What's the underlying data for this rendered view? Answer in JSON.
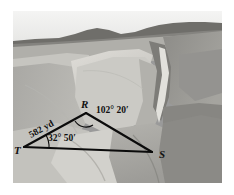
{
  "figure": {
    "type": "survey-diagram-over-photograph",
    "scene_description": "Grayscale aerial photograph of an eroded canyon and mesa landscape with a distant ridge horizon",
    "border_color": "#ffffff",
    "ink_color": "#0b0b0b"
  },
  "triangle": {
    "vertices": [
      {
        "id": "T",
        "label": "T",
        "x": 24,
        "y": 147,
        "label_x": 14,
        "label_y": 154
      },
      {
        "id": "R",
        "label": "R",
        "x": 86,
        "y": 113,
        "label_x": 81,
        "label_y": 108
      },
      {
        "id": "S",
        "label": "S",
        "x": 152,
        "y": 152,
        "label_x": 159,
        "label_y": 158
      }
    ],
    "sides": [
      {
        "from": "T",
        "to": "R",
        "label": "582 yd"
      },
      {
        "from": "R",
        "to": "S",
        "label": ""
      },
      {
        "from": "T",
        "to": "S",
        "label": ""
      }
    ],
    "measurements": [
      {
        "at": "T",
        "text": "32° 50′",
        "value_degrees": 32,
        "value_minutes": 50
      },
      {
        "at": "R",
        "text": "102° 20′",
        "value_degrees": 102,
        "value_minutes": 20
      }
    ],
    "distance": {
      "side": "TR",
      "text": "582 yd",
      "value": 582,
      "unit": "yd",
      "rotation_deg": -29
    }
  },
  "labels": {
    "vertex_t": "T",
    "vertex_r": "R",
    "vertex_s": "S",
    "distance_tr": "582 yd",
    "angle_r": "102° 20′",
    "angle_t": "32° 50′"
  },
  "palette": {
    "sky": "#f0f0ef",
    "ridge_dark": "#5d5d5d",
    "ridge_mid": "#7b7b7b",
    "mesa_light": "#c9c8c3",
    "mesa_bright": "#d8d7d2",
    "slope_mid": "#a3a29e",
    "slope_dark": "#8a8986",
    "canyon_shadow": "#74736f",
    "foreground_light": "#bcbbb6",
    "foreground_mid": "#a8a7a2",
    "foreground_dark": "#8f8e8a"
  }
}
